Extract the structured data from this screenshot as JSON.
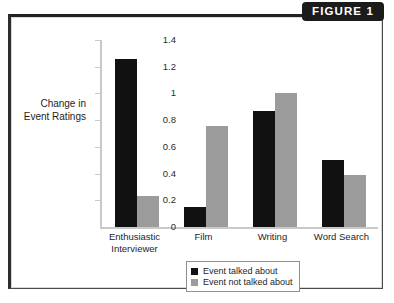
{
  "figure": {
    "banner_label": "FIGURE 1"
  },
  "chart_data": {
    "type": "bar",
    "title": "",
    "xlabel": "",
    "ylabel": "Change in Event Ratings",
    "ylabel_lines": [
      "Change in",
      "Event Ratings"
    ],
    "ylim": [
      0,
      1.4
    ],
    "ytick_labels": [
      "0",
      "0.2",
      "0.4",
      "0.6",
      "0.8",
      "1",
      "1.2",
      "1.4"
    ],
    "ytick_values": [
      0,
      0.2,
      0.4,
      0.6,
      0.8,
      1.0,
      1.2,
      1.4
    ],
    "grid": false,
    "legend_position": "bottom-center",
    "categories": [
      "Enthusiastic Interviewer",
      "Film",
      "Writing",
      "Word Search"
    ],
    "category_lines": [
      [
        "Enthusiastic",
        "Interviewer"
      ],
      [
        "Film"
      ],
      [
        "Writing"
      ],
      [
        "Word Search"
      ]
    ],
    "series": [
      {
        "name": "Event talked about",
        "color": "#111111",
        "values": [
          1.26,
          0.15,
          0.87,
          0.5
        ]
      },
      {
        "name": "Event not talked about",
        "color": "#9b9b9b",
        "values": [
          0.23,
          0.76,
          1.0,
          0.39
        ]
      }
    ]
  },
  "colors": {
    "series_dark": "#111111",
    "series_light": "#9b9b9b",
    "banner_bg": "#1b1b1b",
    "banner_text": "#ffffff",
    "frame_border": "#222222",
    "axis": "#c9c9c9"
  }
}
